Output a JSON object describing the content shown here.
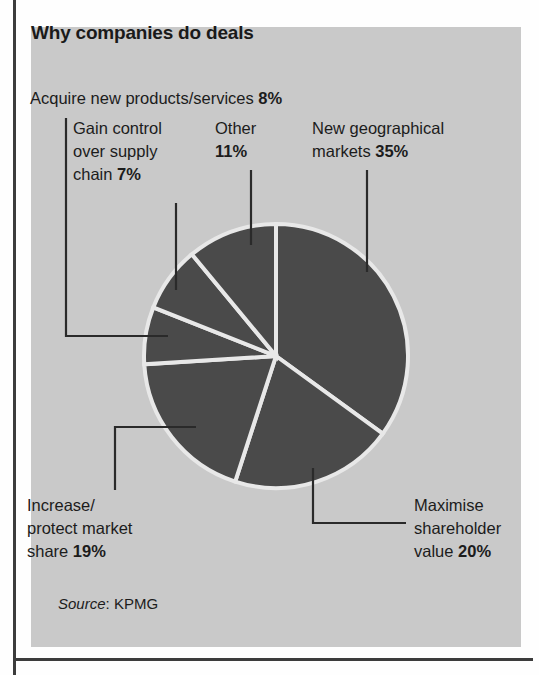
{
  "panel": {
    "background_color": "#c9c9c9",
    "title": "Why companies do deals"
  },
  "frame": {
    "rule_color": "#3c3c3c"
  },
  "source": {
    "label_word": "Source",
    "separator": ": ",
    "value": "KPMG",
    "full_text": "Source: KPMG"
  },
  "labels": {
    "acquire": {
      "line1": "Acquire new products/services ",
      "value": "8%"
    },
    "gain": {
      "line1": "Gain control",
      "line2": "over supply",
      "line3": "chain ",
      "value": "7%"
    },
    "other": {
      "line1": "Other",
      "value": "11%"
    },
    "newgeo": {
      "line1": "New geographical",
      "line2": "markets ",
      "value": "35%"
    },
    "increase": {
      "line1": "Increase/",
      "line2": "protect market",
      "line3": "share ",
      "value": "19%"
    },
    "maximise": {
      "line1": "Maximise",
      "line2": "shareholder",
      "line3": "value ",
      "value": "20%"
    }
  },
  "chart_data": {
    "type": "pie",
    "title": "Why companies do deals",
    "source": "KPMG",
    "unit": "%",
    "start_angle_deg": 0,
    "direction": "clockwise",
    "slice_color": "#4a4a4a",
    "separator_color": "#e8e8e8",
    "background_color": "#c9c9c9",
    "legend": "callout-labels",
    "center": {
      "x": 276,
      "y": 356
    },
    "radius": 132,
    "categories": [
      "New geographical markets",
      "Maximise shareholder value",
      "Increase/protect market share",
      "Gain control over supply chain",
      "Acquire new products/services",
      "Other"
    ],
    "values": [
      35,
      20,
      19,
      7,
      8,
      11
    ],
    "slices": [
      {
        "label": "New geographical markets",
        "value": 35,
        "start_deg": 0.0,
        "end_deg": 126.0
      },
      {
        "label": "Maximise shareholder value",
        "value": 20,
        "start_deg": 126.0,
        "end_deg": 198.0
      },
      {
        "label": "Increase/protect market share",
        "value": 19,
        "start_deg": 198.0,
        "end_deg": 266.4
      },
      {
        "label": "Gain control over supply chain",
        "value": 7,
        "start_deg": 266.4,
        "end_deg": 291.6
      },
      {
        "label": "Acquire new products/services",
        "value": 8,
        "start_deg": 291.6,
        "end_deg": 320.4
      },
      {
        "label": "Other",
        "value": 11,
        "start_deg": 320.4,
        "end_deg": 360.0
      }
    ],
    "total": 100
  }
}
